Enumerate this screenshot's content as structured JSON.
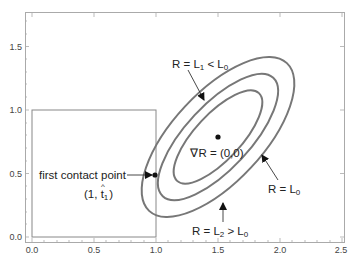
{
  "axes": {
    "x_ticks": [
      "0.0",
      "0.5",
      "1.0",
      "1.5",
      "2.0",
      "2.5"
    ],
    "y_ticks": [
      "0.0",
      "0.5",
      "1.0",
      "1.5"
    ],
    "xlim": [
      0,
      2.5
    ],
    "ylim": [
      0,
      1.75
    ]
  },
  "labels": {
    "contour_inner": {
      "prefix": "R = L",
      "sub1": "1",
      "mid": " < L",
      "sub2": "0"
    },
    "contour_mid": {
      "prefix": "R = L",
      "sub1": "0"
    },
    "contour_outer": {
      "prefix": "R = L",
      "sub1": "2",
      "mid": " > L",
      "sub2": "0"
    },
    "gradient": "∇R = (0,0)",
    "contact": "first contact point",
    "contact_coord": {
      "open": "(1, ",
      "t": "t",
      "hat": "^",
      "sub": "1",
      "close": ")"
    }
  },
  "colors": {
    "contour": "#777777",
    "frame": "#999999",
    "box": "#777777",
    "text": "#222222"
  }
}
